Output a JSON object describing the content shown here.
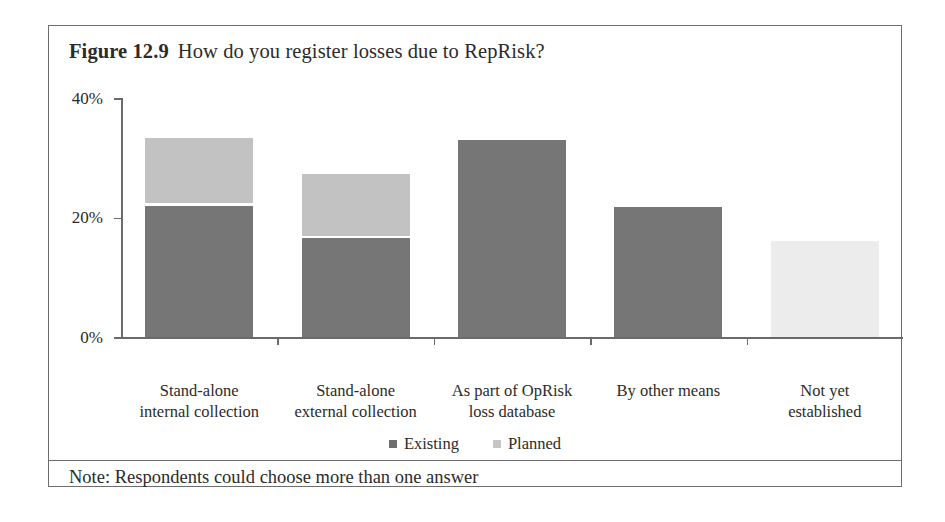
{
  "figure": {
    "label": "Figure 12.9",
    "question": "How do you register losses due to RepRisk?",
    "note": "Note: Respondents could choose more than one answer"
  },
  "legend": {
    "position": "bottom-center",
    "items": [
      {
        "label": "Existing",
        "color": "#6e6e6e",
        "swatch": "square-marker-icon"
      },
      {
        "label": "Planned",
        "color": "#c6c6c6",
        "swatch": "square-marker-icon"
      }
    ]
  },
  "axis": {
    "y_ticks": [
      "0%",
      "20%",
      "40%"
    ],
    "y_min": 0,
    "y_max": 40
  },
  "colors": {
    "existing": "#767676",
    "planned": "#c2c2c2",
    "planned_pale": "#ececec",
    "frame": "#6d6d6d",
    "axis": "#6a6a6a",
    "text": "#2b2b2b"
  },
  "chart_data": {
    "type": "bar",
    "stacked": true,
    "xlabel": "",
    "ylabel": "",
    "ylim": [
      0,
      40
    ],
    "yticks": [
      0,
      20,
      40
    ],
    "ytick_labels": [
      "0%",
      "20%",
      "40%"
    ],
    "grid": false,
    "legend_position": "bottom-center",
    "annotations": [
      "Note: Respondents could choose more than one answer"
    ],
    "categories": [
      "Stand-alone internal collection",
      "Stand-alone external collection",
      "As part of OpRisk loss database",
      "By other means",
      "Not yet established"
    ],
    "category_lines": [
      [
        "Stand-alone",
        "internal collection"
      ],
      [
        "Stand-alone",
        "external collection"
      ],
      [
        "As part of OpRisk",
        "loss database"
      ],
      [
        "By other means",
        ""
      ],
      [
        "Not yet",
        "established"
      ]
    ],
    "series": [
      {
        "name": "Existing",
        "color": "#767676",
        "values": [
          22.0,
          16.5,
          33.0,
          21.8,
          0.0
        ]
      },
      {
        "name": "Planned",
        "color": "#c2c2c2",
        "values": [
          11.3,
          10.8,
          0.0,
          0.0,
          16.0
        ]
      }
    ],
    "totals": [
      33.3,
      27.3,
      33.0,
      21.8,
      16.0
    ]
  }
}
